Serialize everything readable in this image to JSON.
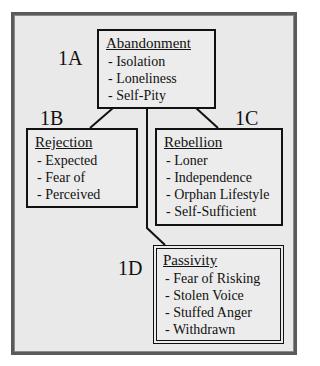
{
  "diagram": {
    "nodes": [
      {
        "id": "1A",
        "label": "1A",
        "title": "Abandonment",
        "items": [
          "- Isolation",
          "- Loneliness",
          "- Self-Pity"
        ]
      },
      {
        "id": "1B",
        "label": "1B",
        "title": "Rejection",
        "items": [
          "- Expected",
          "- Fear of",
          "- Perceived"
        ]
      },
      {
        "id": "1C",
        "label": "1C",
        "title": "Rebellion",
        "items": [
          "- Loner",
          "- Independence",
          "- Orphan Lifestyle",
          "- Self-Sufficient"
        ]
      },
      {
        "id": "1D",
        "label": "1D",
        "title": "Passivity",
        "items": [
          "- Fear of Risking",
          "- Stolen Voice",
          "- Stuffed Anger",
          "- Withdrawn"
        ]
      }
    ],
    "edges": [
      {
        "from": "1A",
        "to": "1B"
      },
      {
        "from": "1A",
        "to": "1C"
      },
      {
        "from": "1A",
        "to": "1D"
      }
    ]
  },
  "colors": {
    "frame_border": "#5a5a5a",
    "frame_fill": "#e9e9e9",
    "line": "#111111"
  }
}
